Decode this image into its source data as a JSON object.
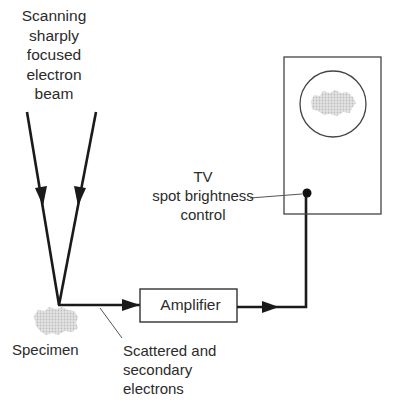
{
  "diagram": {
    "labels": {
      "beam": [
        "Scanning",
        "sharply",
        "focused",
        "electron",
        "beam"
      ],
      "tv": [
        "TV",
        "spot brightness",
        "control"
      ],
      "specimen": "Specimen",
      "amplifier": "Amplifier",
      "scattered": [
        "Scattered and",
        "secondary",
        "electrons"
      ]
    },
    "colors": {
      "ink": "#1a1a1a",
      "thin": "#555555",
      "specimen": "#c8c8c8"
    },
    "nodes": [
      {
        "id": "electron-beam",
        "label": "Scanning sharply focused electron beam"
      },
      {
        "id": "specimen",
        "label": "Specimen"
      },
      {
        "id": "amplifier",
        "label": "Amplifier"
      },
      {
        "id": "tv-screen",
        "label": "TV spot brightness control"
      }
    ],
    "edges": [
      {
        "from": "electron-beam",
        "to": "specimen"
      },
      {
        "from": "specimen",
        "to": "amplifier",
        "label": "Scattered and secondary electrons"
      },
      {
        "from": "amplifier",
        "to": "tv-screen"
      }
    ]
  }
}
